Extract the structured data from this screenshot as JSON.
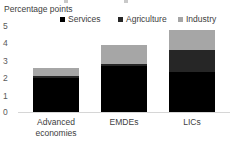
{
  "top_cropped_legend": {
    "visible": true,
    "note": "faint cut-off legend row from figure above",
    "text": ""
  },
  "chart_data": {
    "type": "bar",
    "subtype": "stacked-vertical",
    "title": "",
    "axis_title": "Percentage points",
    "ylabel": "Percentage points",
    "xlabel": "",
    "categories": [
      "Advanced economies",
      "EMDEs",
      "LICs"
    ],
    "series": [
      {
        "name": "Services",
        "color": "#000000",
        "values": [
          1.9,
          2.55,
          2.25
        ]
      },
      {
        "name": "Agriculture",
        "color": "#262626",
        "values": [
          0.1,
          0.1,
          1.2
        ]
      },
      {
        "name": "Industry",
        "color": "#a6a6a6",
        "values": [
          0.45,
          1.1,
          1.1
        ]
      }
    ],
    "totals": [
      2.45,
      3.75,
      4.55
    ],
    "ylim": [
      0,
      5
    ],
    "yticks": [
      "0",
      "1",
      "2",
      "3",
      "4",
      "5"
    ],
    "ytick_values": [
      0,
      1,
      2,
      3,
      4,
      5
    ],
    "grid": false,
    "legend_position": "top",
    "legend": [
      {
        "label": "Services",
        "color": "#000000",
        "marker": "square"
      },
      {
        "label": "Agriculture",
        "color": "#262626",
        "marker": "square"
      },
      {
        "label": "Industry",
        "color": "#a6a6a6",
        "marker": "square"
      }
    ]
  },
  "xlabels": [
    {
      "line1": "Advanced",
      "line2": "economies"
    },
    {
      "line1": "EMDEs",
      "line2": ""
    },
    {
      "line1": "LICs",
      "line2": ""
    }
  ]
}
